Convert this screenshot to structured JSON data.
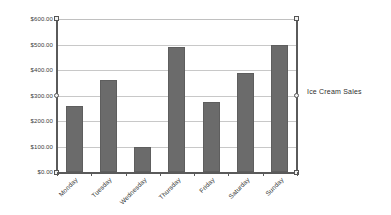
{
  "chart_data": {
    "type": "bar",
    "title": "",
    "subtitle": "",
    "xlabel": "",
    "ylabel": "",
    "categories": [
      "Monday",
      "Tuesday",
      "Wednesday",
      "Thursday",
      "Friday",
      "Saturday",
      "Sunday"
    ],
    "values": [
      260,
      360,
      100,
      490,
      275,
      390,
      500
    ],
    "series": [
      {
        "name": "Ice Cream Sales",
        "values": [
          260,
          360,
          100,
          490,
          275,
          390,
          500
        ],
        "color": "#6b6b6b"
      }
    ],
    "ylim": [
      0,
      600
    ],
    "ytick_values": [
      0,
      100,
      200,
      300,
      400,
      500,
      600
    ],
    "ytick_labels": [
      "$0.00",
      "$100.00",
      "$200.00",
      "$300.00",
      "$400.00",
      "$500.00",
      "$600.00"
    ],
    "value_format": "currency-usd",
    "grid": true,
    "grid_axis": "y",
    "legend_position": "right",
    "legend_entries": [
      "Ice Cream Sales"
    ],
    "xtick_rotation": -45,
    "bar_color": "#6b6b6b",
    "axis_color": "#5a5a5a",
    "gridline_color": "#c8c8c8",
    "background": "#ffffff"
  },
  "legend": {
    "label": "Ice Cream Sales"
  },
  "selection": {
    "state": "selected",
    "handles": [
      {
        "name": "handle-top-left",
        "shape": "square"
      },
      {
        "name": "handle-bottom-left",
        "shape": "square"
      },
      {
        "name": "handle-middle-left",
        "shape": "circle"
      },
      {
        "name": "handle-top-right",
        "shape": "square"
      },
      {
        "name": "handle-bottom-right",
        "shape": "square"
      },
      {
        "name": "handle-middle-right",
        "shape": "circle"
      }
    ]
  }
}
